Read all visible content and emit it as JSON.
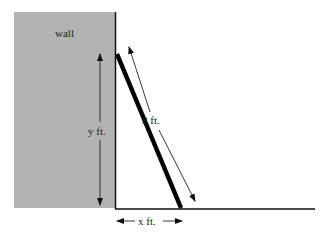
{
  "diagram": {
    "type": "ladder-against-wall",
    "labels": {
      "wall": "wall",
      "ladder_length": "8 ft.",
      "height": "y ft.",
      "base_distance": "x ft."
    },
    "colors": {
      "wall_fill": "#b3b3b3",
      "lines": "#111111",
      "background": "#ffffff"
    },
    "dimensions": {
      "ladder_length_ft": 8,
      "height_var": "y",
      "base_var": "x"
    }
  }
}
